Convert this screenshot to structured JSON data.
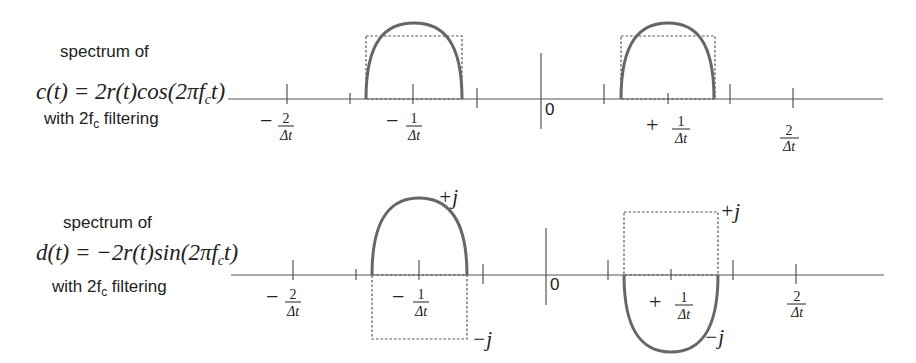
{
  "panels": [
    {
      "id": "c",
      "label_line1": "spectrum of",
      "formula": "c(t) = 2r(t)cos(2πf",
      "formula_sub": "c",
      "formula_tail": "t)",
      "label_line3_pre": "with 2f",
      "label_line3_sub": "c",
      "label_line3_post": " filtering",
      "zero_label": "0",
      "ticks": {
        "neg2": {
          "sign": "−",
          "num": "2",
          "den": "Δt"
        },
        "neg1": {
          "sign": "−",
          "num": "1",
          "den": "Δt"
        },
        "pos1": {
          "sign": "+",
          "num": "1",
          "den": "Δt"
        },
        "pos2": {
          "sign": "",
          "num": "2",
          "den": "Δt"
        }
      }
    },
    {
      "id": "d",
      "label_line1": "spectrum of",
      "formula": "d(t) = −2r(t)sin(2πf",
      "formula_sub": "c",
      "formula_tail": "t)",
      "label_line3_pre": "with 2f",
      "label_line3_sub": "c",
      "label_line3_post": " filtering",
      "zero_label": "0",
      "ticks": {
        "neg2": {
          "sign": "−",
          "num": "2",
          "den": "Δt"
        },
        "neg1": {
          "sign": "−",
          "num": "1",
          "den": "Δt"
        },
        "pos1": {
          "sign": "+",
          "num": "1",
          "den": "Δt"
        },
        "pos2": {
          "sign": "",
          "num": "2",
          "den": "Δt"
        }
      },
      "annotations": {
        "left_plus_j": "+j",
        "left_minus_j": "−j",
        "right_plus_j": "+j",
        "right_minus_j": "−j"
      }
    }
  ],
  "colors": {
    "arc": "#666666",
    "axis": "#555555",
    "text": "#222222"
  }
}
